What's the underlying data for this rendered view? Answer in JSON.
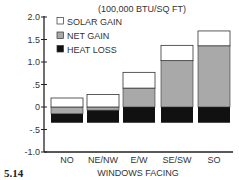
{
  "figure_label": "5.14",
  "chart_data": {
    "type": "bar",
    "stacked": true,
    "title": "(100,000 BTU/SQ FT)",
    "xlabel": "WINDOWS FACING",
    "ylabel": "",
    "categories": [
      "NO",
      "NE/NW",
      "E/W",
      "SE/SW",
      "SO"
    ],
    "series": [
      {
        "name": "SOLAR GAIN",
        "color": "#ffffff",
        "values": [
          0.2,
          0.28,
          0.77,
          1.37,
          1.69
        ]
      },
      {
        "name": "NET GAIN",
        "color": "#a9a9a9",
        "values": [
          -0.15,
          -0.07,
          0.42,
          1.03,
          1.36
        ]
      },
      {
        "name": "HEAT LOSS",
        "color": "#111111",
        "values": [
          -0.35,
          -0.35,
          -0.35,
          -0.35,
          -0.35
        ]
      }
    ],
    "yticks": [
      2.0,
      1.5,
      1.0,
      0.5,
      0,
      -0.5,
      -1.0
    ],
    "ytick_labels": [
      "2.0",
      "1.5",
      "1.0",
      ".5",
      "0",
      "-.5",
      "-1.0"
    ],
    "ylim": [
      -1.0,
      2.0
    ],
    "grid": false,
    "legend_position": "upper-left inside"
  }
}
